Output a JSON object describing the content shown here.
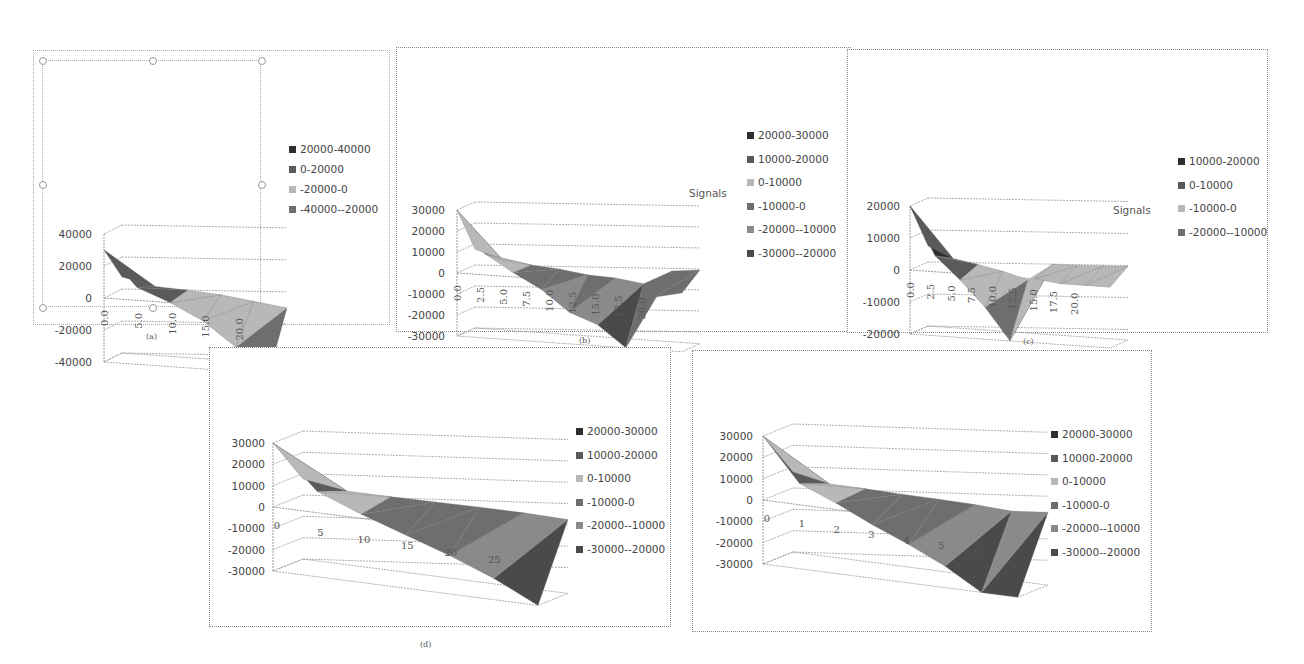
{
  "figure": {
    "captions": [
      "(a)",
      "(b)",
      "(c)",
      "(d)"
    ]
  },
  "chart_data": [
    {
      "id": "a",
      "type": "surface",
      "caption": "(a)",
      "title": "",
      "xlabel": "",
      "ylabel": "",
      "series_label": "",
      "ylim": [
        -40000,
        40000
      ],
      "y_ticks": [
        "40000",
        "20000",
        "0",
        "-20000",
        "-40000"
      ],
      "x_ticks": [
        "0.0",
        "5.0",
        "10.0",
        "15.0",
        "20.0"
      ],
      "x": [
        0,
        5,
        10,
        15,
        20,
        25
      ],
      "values": [
        30000,
        8000,
        0,
        -10000,
        -25000,
        -40000
      ],
      "legend": [
        "20000-40000",
        "0-20000",
        "-20000-0",
        "-40000--20000"
      ],
      "legend_position": "right",
      "grid": true
    },
    {
      "id": "b",
      "type": "surface",
      "caption": "(b)",
      "title": "",
      "xlabel": "",
      "ylabel": "",
      "series_label": "Signals",
      "ylim": [
        -30000,
        30000
      ],
      "y_ticks": [
        "30000",
        "20000",
        "10000",
        "0",
        "-10000",
        "-20000",
        "-30000"
      ],
      "x_ticks": [
        "0.0",
        "2.5",
        "5.0",
        "7.5",
        "10.0",
        "12.5",
        "15.0",
        "17.5",
        "20.0"
      ],
      "x": [
        0,
        2.5,
        5,
        7.5,
        10,
        12.5,
        15,
        17.5,
        20
      ],
      "values": [
        30000,
        10000,
        2000,
        -5000,
        -15000,
        -20000,
        -30000,
        -5000,
        -2000
      ],
      "legend": [
        "20000-30000",
        "10000-20000",
        "0-10000",
        "-10000-0",
        "-20000--10000",
        "-30000--20000"
      ],
      "legend_position": "right",
      "grid": true
    },
    {
      "id": "c",
      "type": "surface",
      "caption": "(c)",
      "title": "",
      "xlabel": "",
      "ylabel": "",
      "series_label": "Signals",
      "ylim": [
        -20000,
        20000
      ],
      "y_ticks": [
        "20000",
        "10000",
        "0",
        "-10000",
        "-20000"
      ],
      "x_ticks": [
        "0.0",
        "2.5",
        "5.0",
        "7.5",
        "10.0",
        "12.5",
        "15.0",
        "17.5",
        "20.0"
      ],
      "x": [
        0,
        2.5,
        5,
        7.5,
        10,
        12.5,
        15,
        17.5,
        20
      ],
      "values": [
        20000,
        5000,
        -2000,
        -10000,
        -20000,
        0,
        -1000,
        -1000,
        -1000
      ],
      "legend": [
        "10000-20000",
        "0-10000",
        "-10000-0",
        "-20000--10000"
      ],
      "legend_position": "right",
      "grid": true
    },
    {
      "id": "d",
      "type": "surface",
      "caption": "(d)",
      "title": "",
      "xlabel": "",
      "ylabel": "",
      "series_label": "",
      "ylim": [
        -30000,
        30000
      ],
      "y_ticks": [
        "30000",
        "20000",
        "10000",
        "0",
        "-10000",
        "-20000",
        "-30000"
      ],
      "x_ticks": [
        "0",
        "5",
        "10",
        "15",
        "20",
        "25"
      ],
      "x": [
        0,
        5,
        10,
        15,
        20,
        25,
        30
      ],
      "values": [
        30000,
        10000,
        2000,
        -5000,
        -12000,
        -20000,
        -30000
      ],
      "legend": [
        "20000-30000",
        "10000-20000",
        "0-10000",
        "-10000-0",
        "-20000--10000",
        "-30000--20000"
      ],
      "legend_position": "right",
      "grid": true
    },
    {
      "id": "e",
      "type": "surface",
      "caption": "",
      "title": "",
      "xlabel": "",
      "ylabel": "",
      "series_label": "",
      "ylim": [
        -30000,
        30000
      ],
      "y_ticks": [
        "30000",
        "20000",
        "10000",
        "0",
        "-10000",
        "-20000",
        "-30000"
      ],
      "x_ticks": [
        "0",
        "1",
        "2",
        "3",
        "4",
        "5",
        "6"
      ],
      "x": [
        0,
        1,
        2,
        3,
        4,
        5,
        6,
        7
      ],
      "values": [
        30000,
        10000,
        3000,
        -5000,
        -12000,
        -20000,
        -30000,
        -30000
      ],
      "legend": [
        "20000-30000",
        "10000-20000",
        "0-10000",
        "-10000-0",
        "-20000--10000",
        "-30000--20000"
      ],
      "legend_position": "right",
      "grid": true
    }
  ],
  "colors": {
    "band_shades": [
      "#2e2e2e",
      "#5a5a5a",
      "#b8b8b8",
      "#6e6e6e",
      "#8a8a8a",
      "#4a4a4a"
    ],
    "grid": "#9a9a9a"
  }
}
